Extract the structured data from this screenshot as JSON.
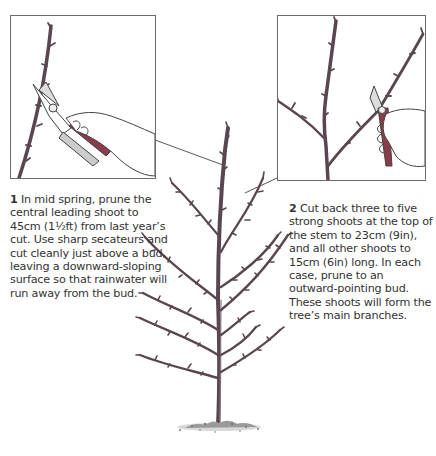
{
  "illustration": {
    "subject": "Pruning a young feathered fruit tree",
    "elements": [
      "main-tree",
      "inset-leader-cut",
      "inset-side-shoot-cut",
      "soil-mound"
    ]
  },
  "steps": [
    {
      "number": "1",
      "text": " In mid spring, prune the central leading shoot to 45cm (1½ft) from last year’s cut. Use sharp secateurs and cut cleanly just above a bud, leaving a downward-sloping surface so that rainwater will run away from the bud."
    },
    {
      "number": "2",
      "text": " Cut back three to five strong shoots at the top of the stem to 23cm (9in), and all other shoots to 15cm (6in) long. In each case, prune to an outward-pointing bud. These shoots will form the tree’s main branches."
    }
  ],
  "colors": {
    "branch": "#6b5560",
    "branch_dark": "#4a3a42",
    "outline": "#555555",
    "secateur_handle": "#8a3c4a",
    "text": "#333333"
  }
}
